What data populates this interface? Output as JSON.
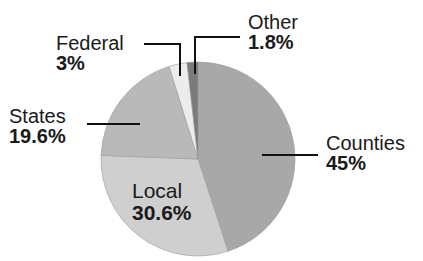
{
  "chart_data": {
    "type": "pie",
    "title": "",
    "start_angle_deg": 0,
    "direction": "clockwise",
    "slices": [
      {
        "label": "Counties",
        "value": 45.0,
        "display": "45%",
        "color": "#a8a8a8"
      },
      {
        "label": "Local",
        "value": 30.6,
        "display": "30.6%",
        "color": "#cfcfcf"
      },
      {
        "label": "States",
        "value": 19.6,
        "display": "19.6%",
        "color": "#b9b9b9"
      },
      {
        "label": "Federal",
        "value": 3.0,
        "display": "3%",
        "color": "#ececec"
      },
      {
        "label": "Other",
        "value": 1.8,
        "display": "1.8%",
        "color": "#7a7a7a"
      }
    ],
    "legend": "none",
    "data_labels": "outside with leader lines (Local inside)"
  },
  "labels": {
    "federal": {
      "name": "Federal",
      "pct": "3%"
    },
    "other": {
      "name": "Other",
      "pct": "1.8%"
    },
    "states": {
      "name": "States",
      "pct": "19.6%"
    },
    "local": {
      "name": "Local",
      "pct": "30.6%"
    },
    "counties": {
      "name": "Counties",
      "pct": "45%"
    }
  }
}
